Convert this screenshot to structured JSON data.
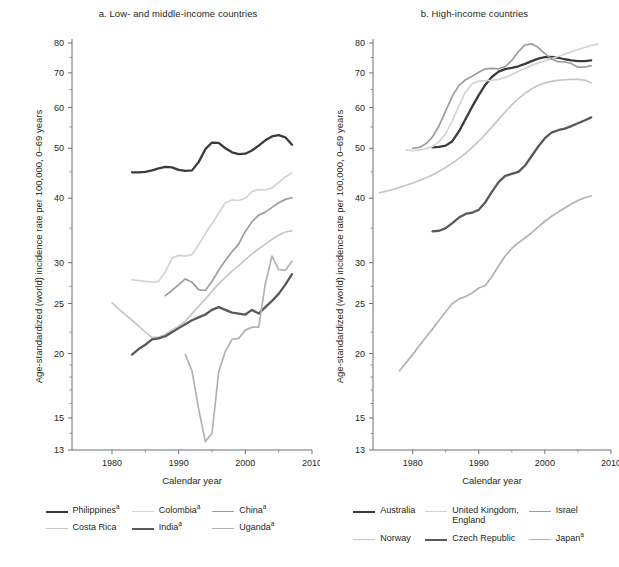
{
  "figure": {
    "xlabel": "Calendar year",
    "ylabel": "Age-standardized (world) incidence rate per 100,000, 0–69 years"
  },
  "axes": {
    "y_ticks": [
      13,
      15,
      20,
      25,
      30,
      40,
      50,
      60,
      70,
      80
    ],
    "y_minor_ticks": [
      14,
      16,
      17,
      18,
      19,
      22,
      27,
      35,
      45,
      55,
      65,
      75
    ],
    "y_scale": "log",
    "ylim": [
      13,
      80
    ],
    "x_ticks": [
      1980,
      1990,
      2000,
      2010
    ],
    "x_minor_ticks": [
      1985,
      1995,
      2005
    ],
    "xlim": [
      1974,
      2010
    ],
    "grid": false
  },
  "panel_a": {
    "title": "a. Low- and middle-income countries",
    "legend": [
      {
        "label": "Philippines",
        "sup": "a",
        "color": "#3b3b3d",
        "width": 2.3
      },
      {
        "label": "Colombia",
        "sup": "a",
        "color": "#d2d3d5",
        "width": 1.7
      },
      {
        "label": "China",
        "sup": "a",
        "color": "#9b9da0",
        "width": 1.7
      },
      {
        "label": "Costa Rica",
        "sup": "",
        "color": "#c4c6c8",
        "width": 1.7
      },
      {
        "label": "India",
        "sup": "a",
        "color": "#58595b",
        "width": 2.3
      },
      {
        "label": "Uganda",
        "sup": "a",
        "color": "#b0b2b4",
        "width": 1.7
      }
    ]
  },
  "panel_b": {
    "title": "b. High-income countries",
    "legend": [
      {
        "label": "Australia",
        "sup": "",
        "color": "#3b3b3d",
        "width": 2.3
      },
      {
        "label": "United Kingdom,\nEngland",
        "sup": "",
        "color": "#d2d3d5",
        "width": 1.7
      },
      {
        "label": "Israel",
        "sup": "",
        "color": "#9b9da0",
        "width": 1.7
      },
      {
        "label": "Norway",
        "sup": "",
        "color": "#c4c6c8",
        "width": 1.7
      },
      {
        "label": "Czech Republic",
        "sup": "",
        "color": "#58595b",
        "width": 2.3
      },
      {
        "label": "Japan",
        "sup": "a",
        "color": "#b0b2b4",
        "width": 1.7
      }
    ]
  },
  "chart_data": [
    {
      "type": "line",
      "panel": "a",
      "title": "a. Low- and middle-income countries",
      "xlabel": "Calendar year",
      "ylabel": "Age-standardized (world) incidence rate per 100,000, 0–69 years",
      "xlim": [
        1974,
        2010
      ],
      "ylim": [
        13,
        80
      ],
      "yscale": "log",
      "legend_position": "below",
      "series": [
        {
          "name": "Philippines",
          "color": "#3b3b3d",
          "x": [
            1983,
            1984,
            1985,
            1986,
            1987,
            1988,
            1989,
            1990,
            1991,
            1992,
            1993,
            1994,
            1995,
            1996,
            1997,
            1998,
            1999,
            2000,
            2001,
            2002,
            2003,
            2004,
            2005,
            2006,
            2007
          ],
          "y": [
            44.9,
            44.9,
            45.0,
            45.3,
            45.7,
            46.0,
            45.9,
            45.4,
            45.2,
            45.3,
            47.0,
            49.8,
            51.3,
            51.2,
            50.0,
            49.1,
            48.7,
            48.8,
            49.5,
            50.6,
            51.8,
            52.7,
            53.0,
            52.5,
            50.8
          ]
        },
        {
          "name": "Colombia",
          "color": "#d2d3d5",
          "x": [
            1983,
            1984,
            1985,
            1986,
            1987,
            1988,
            1989,
            1990,
            1991,
            1992,
            1993,
            1994,
            1995,
            1996,
            1997,
            1998,
            1999,
            2000,
            2001,
            2002,
            2003,
            2004,
            2005,
            2006,
            2007
          ],
          "y": [
            27.8,
            27.7,
            27.6,
            27.5,
            27.6,
            28.8,
            30.6,
            31.0,
            30.9,
            31.1,
            32.5,
            34.2,
            35.7,
            37.4,
            39.2,
            39.7,
            39.6,
            40.0,
            41.2,
            41.6,
            41.5,
            41.9,
            42.9,
            44.0,
            44.8
          ]
        },
        {
          "name": "China",
          "color": "#9b9da0",
          "x": [
            1988,
            1989,
            1990,
            1991,
            1992,
            1993,
            1994,
            1995,
            1996,
            1997,
            1998,
            1999,
            2000,
            2001,
            2002,
            2003,
            2004,
            2005,
            2006,
            2007
          ],
          "y": [
            25.9,
            26.5,
            27.2,
            27.9,
            27.5,
            26.6,
            26.5,
            27.6,
            29.0,
            30.3,
            31.5,
            32.6,
            34.5,
            36.0,
            37.1,
            37.6,
            38.4,
            39.2,
            39.8,
            40.1
          ]
        },
        {
          "name": "Costa Rica",
          "color": "#c4c6c8",
          "x": [
            1980,
            1981,
            1982,
            1983,
            1984,
            1985,
            1986,
            1987,
            1988,
            1989,
            1990,
            1991,
            1992,
            1993,
            1994,
            1995,
            1996,
            1997,
            1998,
            1999,
            2000,
            2001,
            2002,
            2003,
            2004,
            2005,
            2006,
            2007
          ],
          "y": [
            25.1,
            24.4,
            23.8,
            23.2,
            22.6,
            22.0,
            21.5,
            21.5,
            21.8,
            22.2,
            22.6,
            23.1,
            23.9,
            24.7,
            25.5,
            26.4,
            27.3,
            28.1,
            28.9,
            29.6,
            30.4,
            31.2,
            31.9,
            32.6,
            33.3,
            33.9,
            34.4,
            34.6
          ]
        },
        {
          "name": "India",
          "color": "#58595b",
          "x": [
            1983,
            1984,
            1985,
            1986,
            1987,
            1988,
            1989,
            1990,
            1991,
            1992,
            1993,
            1994,
            1995,
            1996,
            1997,
            1998,
            1999,
            2000,
            2001,
            2002,
            2003,
            2004,
            2005,
            2006,
            2007
          ],
          "y": [
            19.9,
            20.4,
            20.8,
            21.3,
            21.4,
            21.6,
            22.0,
            22.4,
            22.8,
            23.2,
            23.5,
            23.8,
            24.3,
            24.6,
            24.3,
            24.0,
            23.9,
            23.8,
            24.3,
            23.9,
            24.6,
            25.3,
            26.1,
            27.2,
            28.5
          ]
        },
        {
          "name": "Uganda",
          "color": "#b0b2b4",
          "x": [
            1991,
            1992,
            1993,
            1994,
            1995,
            1996,
            1997,
            1998,
            1999,
            2000,
            2001,
            2002,
            2003,
            2004,
            2005,
            2006,
            2007
          ],
          "y": [
            19.9,
            18.5,
            15.6,
            13.5,
            14.0,
            18.4,
            20.2,
            21.3,
            21.4,
            22.2,
            22.5,
            22.5,
            27.3,
            30.9,
            29.1,
            29.0,
            30.2
          ]
        }
      ]
    },
    {
      "type": "line",
      "panel": "b",
      "title": "b. High-income countries",
      "xlabel": "Calendar year",
      "ylabel": "Age-standardized (world) incidence rate per 100,000, 0–69 years",
      "xlim": [
        1974,
        2010
      ],
      "ylim": [
        13,
        80
      ],
      "yscale": "log",
      "legend_position": "below",
      "series": [
        {
          "name": "Australia",
          "color": "#3b3b3d",
          "x": [
            1983,
            1984,
            1985,
            1986,
            1987,
            1988,
            1989,
            1990,
            1991,
            1992,
            1993,
            1994,
            1995,
            1996,
            1997,
            1998,
            1999,
            2000,
            2001,
            2002,
            2003,
            2004,
            2005,
            2006,
            2007
          ],
          "y": [
            50.2,
            50.3,
            50.6,
            51.6,
            53.9,
            57.0,
            60.2,
            63.4,
            66.4,
            68.8,
            70.4,
            71.2,
            71.6,
            72.1,
            72.9,
            73.8,
            74.6,
            75.1,
            75.2,
            74.9,
            74.4,
            74.0,
            73.8,
            73.8,
            74.0
          ]
        },
        {
          "name": "United Kingdom, England",
          "color": "#d2d3d5",
          "x": [
            1979,
            1980,
            1981,
            1982,
            1983,
            1984,
            1985,
            1986,
            1987,
            1988,
            1989,
            1990,
            1991,
            1992,
            1993,
            1994,
            1995,
            1996,
            1997,
            1998,
            1999,
            2000,
            2001,
            2002,
            2003,
            2004,
            2005,
            2006,
            2007,
            2008
          ],
          "y": [
            49.6,
            49.5,
            49.6,
            49.9,
            50.4,
            51.5,
            53.4,
            56.5,
            60.5,
            64.3,
            66.7,
            67.5,
            67.6,
            67.7,
            68.0,
            68.6,
            69.5,
            70.5,
            71.5,
            72.4,
            73.2,
            73.9,
            74.6,
            75.3,
            76.1,
            76.9,
            77.7,
            78.4,
            79.1,
            79.6
          ]
        },
        {
          "name": "Israel",
          "color": "#9b9da0",
          "x": [
            1980,
            1981,
            1982,
            1983,
            1984,
            1985,
            1986,
            1987,
            1988,
            1989,
            1990,
            1991,
            1992,
            1993,
            1994,
            1995,
            1996,
            1997,
            1998,
            1999,
            2000,
            2001,
            2002,
            2003,
            2004,
            2005,
            2006,
            2007
          ],
          "y": [
            50.0,
            50.2,
            51.0,
            52.6,
            55.3,
            59.1,
            63.1,
            66.2,
            67.9,
            69.0,
            70.2,
            71.3,
            71.4,
            71.3,
            72.0,
            74.0,
            77.0,
            79.3,
            79.7,
            78.4,
            76.3,
            74.5,
            73.6,
            73.5,
            73.0,
            71.8,
            71.8,
            72.3
          ]
        },
        {
          "name": "Norway",
          "color": "#c4c6c8",
          "x": [
            1975,
            1976,
            1977,
            1978,
            1979,
            1980,
            1981,
            1982,
            1983,
            1984,
            1985,
            1986,
            1987,
            1988,
            1989,
            1990,
            1991,
            1992,
            1993,
            1994,
            1995,
            1996,
            1997,
            1998,
            1999,
            2000,
            2001,
            2002,
            2003,
            2004,
            2005,
            2006,
            2007
          ],
          "y": [
            41.0,
            41.3,
            41.6,
            42.0,
            42.4,
            42.8,
            43.3,
            43.8,
            44.4,
            45.1,
            45.9,
            46.8,
            47.8,
            48.9,
            50.2,
            51.6,
            53.2,
            55.0,
            56.9,
            58.8,
            60.7,
            62.4,
            63.9,
            65.2,
            66.2,
            66.9,
            67.4,
            67.7,
            67.9,
            68.0,
            68.0,
            67.8,
            67.0
          ]
        },
        {
          "name": "Czech Republic",
          "color": "#58595b",
          "x": [
            1983,
            1984,
            1985,
            1986,
            1987,
            1988,
            1989,
            1990,
            1991,
            1992,
            1993,
            1994,
            1995,
            1996,
            1997,
            1998,
            1999,
            2000,
            2001,
            2002,
            2003,
            2004,
            2005,
            2006,
            2007
          ],
          "y": [
            34.5,
            34.6,
            35.0,
            35.8,
            36.7,
            37.3,
            37.5,
            38.0,
            39.3,
            41.2,
            43.0,
            44.2,
            44.6,
            45.0,
            46.3,
            48.3,
            50.4,
            52.3,
            53.6,
            54.2,
            54.6,
            55.2,
            55.9,
            56.6,
            57.4
          ]
        },
        {
          "name": "Japan",
          "color": "#b0b2b4",
          "x": [
            1978,
            1979,
            1980,
            1981,
            1982,
            1983,
            1984,
            1985,
            1986,
            1987,
            1988,
            1989,
            1990,
            1991,
            1992,
            1993,
            1994,
            1995,
            1996,
            1997,
            1998,
            1999,
            2000,
            2001,
            2002,
            2003,
            2004,
            2005,
            2006,
            2007
          ],
          "y": [
            18.5,
            19.2,
            19.9,
            20.7,
            21.5,
            22.3,
            23.2,
            24.1,
            25.0,
            25.5,
            25.8,
            26.2,
            26.8,
            27.1,
            28.2,
            29.6,
            30.9,
            32.0,
            32.8,
            33.5,
            34.3,
            35.2,
            36.1,
            36.9,
            37.6,
            38.3,
            39.0,
            39.6,
            40.1,
            40.4
          ]
        }
      ]
    }
  ]
}
